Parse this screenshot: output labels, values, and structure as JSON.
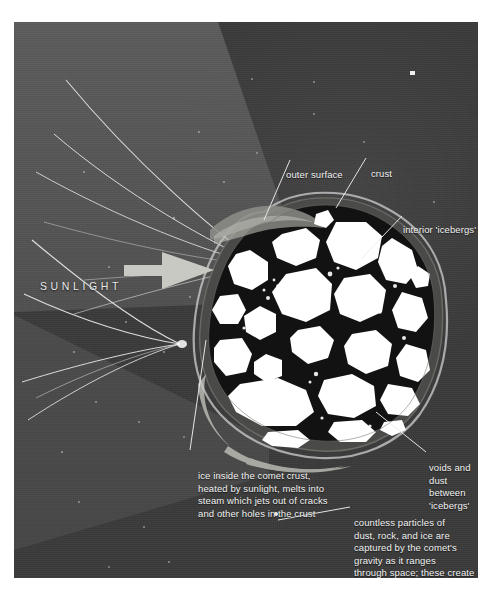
{
  "figure": {
    "background_color": "#3a3a3a",
    "beam_color": "#585858",
    "label_color": "#f2f2f2",
    "crust_color": "#1a1a1a",
    "iceberg_color": "#ffffff"
  },
  "labels": {
    "sunlight": "SUNLIGHT",
    "outer_surface": "outer surface",
    "crust": "crust",
    "interior_icebergs": "interior 'icebergs'",
    "voids_and_dust": "voids and\ndust between\n'icebergs'",
    "ice_inside": "ice inside the comet crust,\nheated by sunlight, melts into\nsteam which jets out of cracks\nand other holes in the crust",
    "countless_particles": "countless particles of\ndust, rock, and ice are\ncaptured by the comet's\ngravity as it ranges\nthrough space; these create\nthe comet's tail"
  },
  "icons": {
    "sun_arrow": "right-arrow-icon",
    "star_speck": "star-speck-icon"
  }
}
